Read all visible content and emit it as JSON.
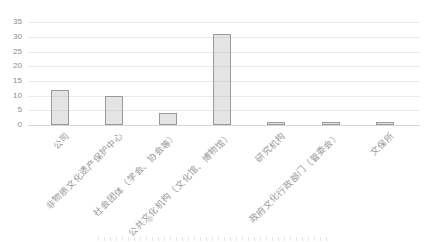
{
  "chart_data": {
    "type": "bar",
    "categories": [
      "公司",
      "非物质文化遗产保护中心",
      "社会团体（学会、协会等）",
      "公共文化机构（文化馆、博物馆）",
      "研究机构",
      "政府文化行政部门（管委会）",
      "文保所"
    ],
    "values": [
      12,
      10,
      4,
      31,
      1,
      1,
      1
    ],
    "title": "",
    "xlabel": "",
    "ylabel": "",
    "ylim": [
      0,
      35
    ],
    "ytick_step": 5,
    "grid": true,
    "legend_position": "none",
    "bar_fill_color": "#e3e3e3",
    "bar_border_color": "#9a9a9a",
    "gridline_color": "#eaeaea",
    "tick_label_color": "#8c8c8c",
    "xlabel_color": "#999999",
    "xlabel_rotation_deg": -45
  }
}
